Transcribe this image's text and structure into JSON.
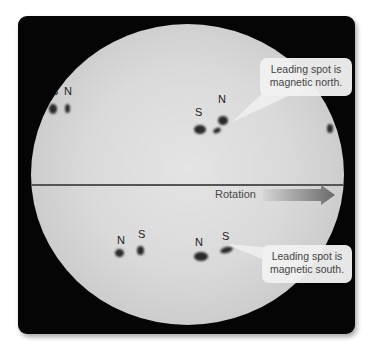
{
  "figure": {
    "colors": {
      "panel": "#050505",
      "sun_center": "#e4e4e4",
      "sun_limb": "#a6a6a6",
      "spot": "#2a2a2a",
      "callout_bg": "#f0f0f0",
      "arrow_start": "#cfcfcf",
      "arrow_end": "#6a6a6a"
    }
  },
  "labels": {
    "upper_left_pair": {
      "left": "S",
      "right": "N"
    },
    "upper_right_pair": {
      "left": "S",
      "right": "N"
    },
    "lower_left_pair": {
      "left": "N",
      "right": "S"
    },
    "lower_right_pair": {
      "left": "N",
      "right": "S"
    }
  },
  "rotation": {
    "label": "Rotation",
    "direction": "right-arrow-icon"
  },
  "callouts": {
    "north": {
      "line1": "Leading spot is",
      "line2": "magnetic north."
    },
    "south": {
      "line1": "Leading spot is",
      "line2": "magnetic south."
    }
  }
}
